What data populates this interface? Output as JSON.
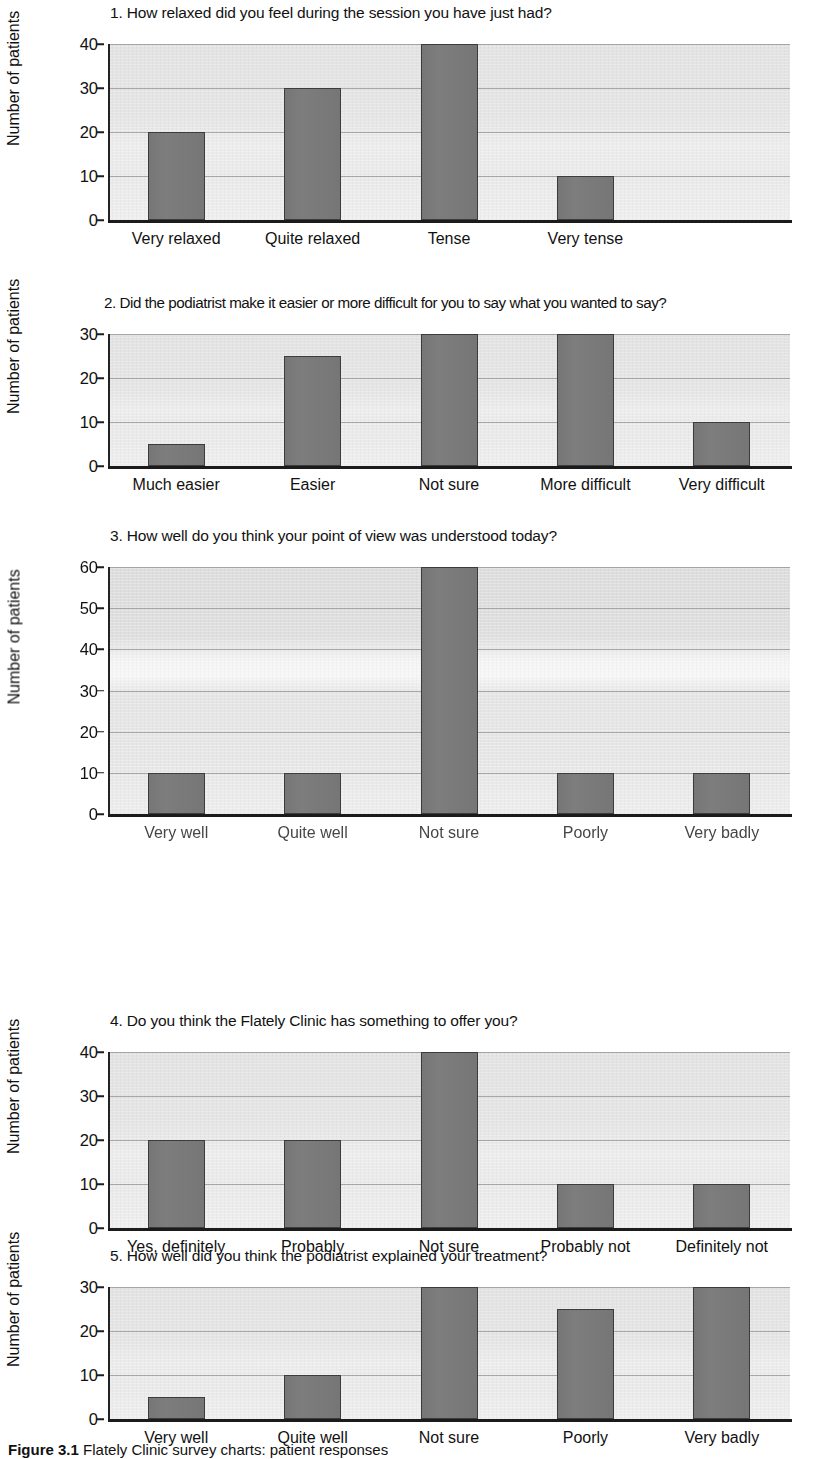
{
  "figure": {
    "caption_prefix": "Figure",
    "caption_number": "3.1",
    "caption_text": "Flately Clinic survey charts: patient responses"
  },
  "shared": {
    "ylabel": "Number of patients",
    "ylabel_degraded": "Number of patients"
  },
  "chart_data": [
    {
      "id": "q1",
      "type": "bar",
      "title": "1. How relaxed did you feel during the session you have just had?",
      "xlabel": "",
      "ylabel": "Number of patients",
      "categories": [
        "Very relaxed",
        "Quite relaxed",
        "Tense",
        "Very tense"
      ],
      "values": [
        20,
        30,
        40,
        10
      ],
      "ylim": [
        0,
        40
      ],
      "yticks": [
        0,
        10,
        20,
        30,
        40
      ],
      "grid": true,
      "legend": "none",
      "slots": 5
    },
    {
      "id": "q2",
      "type": "bar",
      "title": "2. Did the podiatrist make it easier or more difficult for you to say what you wanted to say?",
      "xlabel": "",
      "ylabel": "Number of patients",
      "categories": [
        "Much easier",
        "Easier",
        "Not sure",
        "More difficult",
        "Very difficult"
      ],
      "values": [
        5,
        25,
        30,
        30,
        10
      ],
      "ylim": [
        0,
        30
      ],
      "yticks": [
        0,
        10,
        20,
        30
      ],
      "grid": true,
      "legend": "none",
      "slots": 5
    },
    {
      "id": "q3",
      "type": "bar",
      "title": "3. How well do you think your point of view was understood today?",
      "xlabel": "",
      "ylabel": "Number of patients",
      "categories": [
        "Very well",
        "Quite well",
        "Not sure",
        "Poorly",
        "Very badly"
      ],
      "values": [
        10,
        10,
        60,
        10,
        10
      ],
      "ylim": [
        0,
        60
      ],
      "yticks": [
        0,
        10,
        20,
        30,
        40,
        50,
        60
      ],
      "grid": true,
      "legend": "none",
      "slots": 5
    },
    {
      "id": "q4",
      "type": "bar",
      "title": "4. Do you think the Flately Clinic has something to offer you?",
      "xlabel": "",
      "ylabel": "Number of patients",
      "categories": [
        "Yes, definitely",
        "Probably",
        "Not sure",
        "Probably not",
        "Definitely not"
      ],
      "values": [
        20,
        20,
        40,
        10,
        10
      ],
      "ylim": [
        0,
        40
      ],
      "yticks": [
        0,
        10,
        20,
        30,
        40
      ],
      "grid": true,
      "legend": "none",
      "slots": 5
    },
    {
      "id": "q5",
      "type": "bar",
      "title": "5. How well did you think the podiatrist explained your treatment?",
      "xlabel": "",
      "ylabel": "Number of patients",
      "categories": [
        "Very well",
        "Quite well",
        "Not sure",
        "Poorly",
        "Very badly"
      ],
      "values": [
        5,
        10,
        30,
        25,
        30
      ],
      "ylim": [
        0,
        30
      ],
      "yticks": [
        0,
        10,
        20,
        30
      ],
      "grid": true,
      "legend": "none",
      "slots": 5
    }
  ]
}
